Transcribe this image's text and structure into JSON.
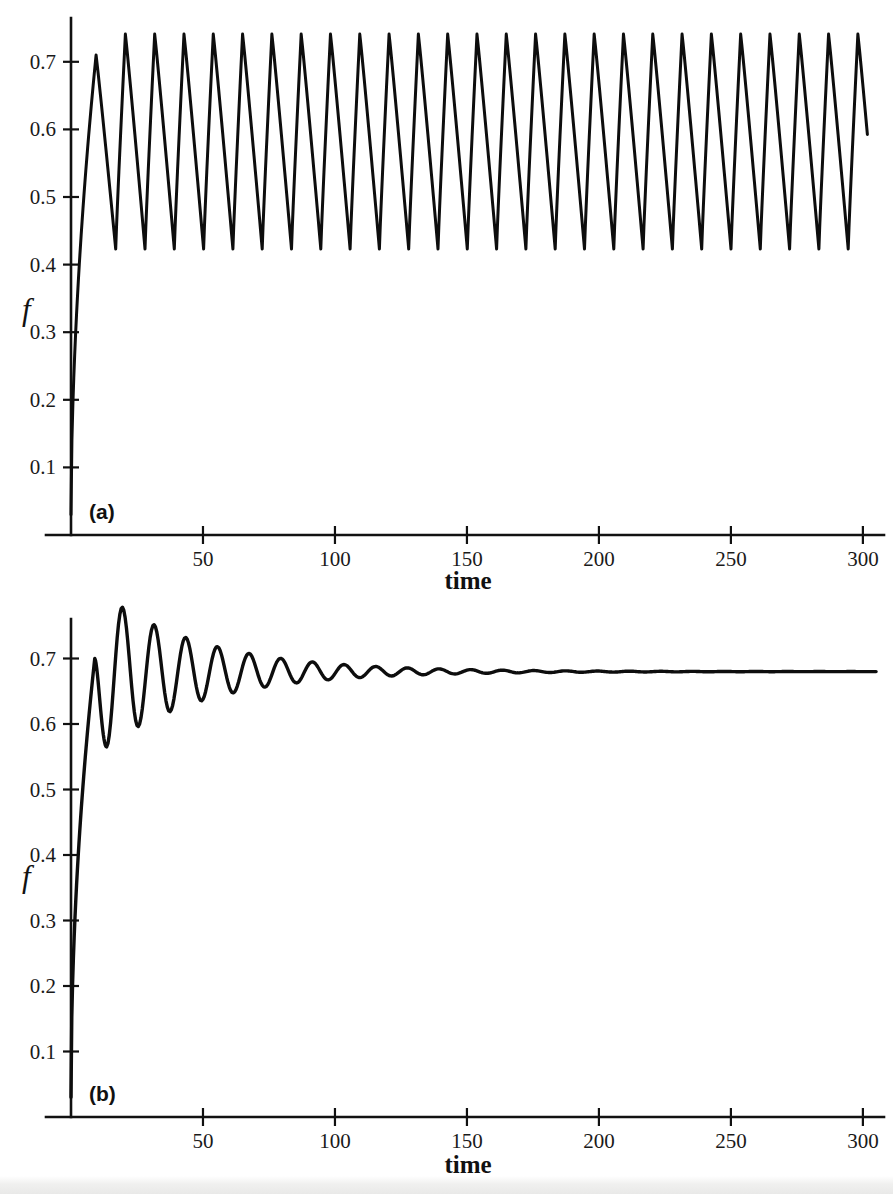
{
  "figure": {
    "background_color": "#ffffff",
    "curve_color": "#0d0d0d",
    "axis_color": "#111111"
  },
  "panels": [
    {
      "id": "a",
      "label": "(a)",
      "xlabel": "time",
      "ylabel": "f",
      "xticks": [
        "50",
        "100",
        "150",
        "200",
        "250",
        "300"
      ],
      "yticks": [
        "0.1",
        "0.2",
        "0.3",
        "0.4",
        "0.5",
        "0.6",
        "0.7"
      ]
    },
    {
      "id": "b",
      "label": "(b)",
      "xlabel": "time",
      "ylabel": "f",
      "xticks": [
        "50",
        "100",
        "150",
        "200",
        "250",
        "300"
      ],
      "yticks": [
        "0.1",
        "0.2",
        "0.3",
        "0.4",
        "0.5",
        "0.6",
        "0.7"
      ]
    }
  ],
  "chart_data": [
    {
      "type": "line",
      "panel": "a",
      "title": "",
      "xlabel": "time",
      "ylabel": "f",
      "xlim": [
        0,
        308
      ],
      "ylim": [
        0,
        0.76
      ],
      "xticks": [
        50,
        100,
        150,
        200,
        250,
        300
      ],
      "yticks": [
        0.1,
        0.2,
        0.3,
        0.4,
        0.5,
        0.6,
        0.7
      ],
      "grid": false,
      "legend": false,
      "annotation": "(a)",
      "description": "Sustained (limit-cycle) relaxation oscillations: sharp rise from near zero to a first peak of about 0.71, then undamped sawtooth-like oscillation between roughly 0.42 and 0.74 for the rest of the run.",
      "series": [
        {
          "name": "f(t)",
          "waveform": "sustained-sawtooth",
          "initial_value": 0.03,
          "rise_end_time": 9.5,
          "first_peak_time": 9.5,
          "first_peak_value": 0.71,
          "period": 11.1,
          "peak_value": 0.741,
          "trough_value": 0.423,
          "peak_phase_fraction": 0.33,
          "x_end": 302
        }
      ]
    },
    {
      "type": "line",
      "panel": "b",
      "title": "",
      "xlabel": "time",
      "ylabel": "f",
      "xlim": [
        0,
        308
      ],
      "ylim": [
        0,
        0.76
      ],
      "xticks": [
        50,
        100,
        150,
        200,
        250,
        300
      ],
      "yticks": [
        0.1,
        0.2,
        0.3,
        0.4,
        0.5,
        0.6,
        0.7
      ],
      "grid": false,
      "legend": false,
      "annotation": "(b)",
      "description": "Damped oscillations converging to a stable steady state: sharp rise to a first peak of about 0.70, a dip to 0.565, then smooth oscillations of decaying amplitude settling at about 0.680 well before t = 300.",
      "series": [
        {
          "name": "f(t)",
          "waveform": "damped-oscillation",
          "initial_value": 0.03,
          "first_peak_time": 9.0,
          "first_peak_value": 0.7,
          "first_trough_time": 13.5,
          "first_trough_value": 0.565,
          "second_peak_time": 21.5,
          "second_peak_value": 0.723,
          "steady_state": 0.68,
          "period": 12.0,
          "decay_constant": 38.0,
          "x_end": 305
        }
      ]
    }
  ]
}
